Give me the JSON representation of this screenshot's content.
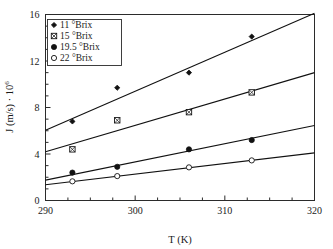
{
  "chart_data": {
    "type": "scatter",
    "title": "",
    "xlabel": "T (K)",
    "ylabel": "J (m/s) · 10",
    "ylabel_exponent": "6",
    "xlim": [
      290,
      320
    ],
    "ylim": [
      0,
      16
    ],
    "x_ticks": [
      290,
      300,
      310,
      320
    ],
    "y_ticks": [
      0,
      4,
      8,
      12,
      16
    ],
    "x_tick_labels": [
      "290",
      "300",
      "310",
      "320"
    ],
    "y_tick_labels": [
      "0",
      "4",
      "8",
      "12",
      "16"
    ],
    "x_minor_step": 2.5,
    "y_minor_step": 1,
    "grid": false,
    "legend_position": "top-left",
    "series": [
      {
        "name": "11 °Brix",
        "marker": "filled-diamond",
        "x": [
          293,
          298,
          306,
          313
        ],
        "values": [
          6.8,
          9.7,
          11.0,
          14.1
        ],
        "fit_line": {
          "x": [
            290,
            320
          ],
          "y": [
            6.05,
            16.1
          ]
        }
      },
      {
        "name": "15 °Brix",
        "marker": "crossed-square",
        "x": [
          293,
          298,
          306,
          313
        ],
        "values": [
          4.4,
          6.9,
          7.6,
          9.3
        ],
        "fit_line": {
          "x": [
            290,
            320
          ],
          "y": [
            4.2,
            11.0
          ]
        }
      },
      {
        "name": "19.5 °Brix",
        "marker": "filled-circle",
        "x": [
          293,
          298,
          306,
          313
        ],
        "values": [
          2.4,
          2.9,
          4.4,
          5.2
        ],
        "fit_line": {
          "x": [
            290,
            320
          ],
          "y": [
            1.75,
            6.45
          ]
        }
      },
      {
        "name": "22 °Brix",
        "marker": "open-circle",
        "x": [
          293,
          298,
          306,
          313
        ],
        "values": [
          1.65,
          2.1,
          2.85,
          3.45
        ],
        "fit_line": {
          "x": [
            290,
            320
          ],
          "y": [
            1.35,
            4.1
          ]
        }
      }
    ]
  },
  "legend": {
    "entries": [
      {
        "label": "11 °Brix",
        "marker": "filled-diamond"
      },
      {
        "label": "15 °Brix",
        "marker": "crossed-square"
      },
      {
        "label": "19.5 °Brix",
        "marker": "filled-circle"
      },
      {
        "label": "22 °Brix",
        "marker": "open-circle"
      }
    ]
  },
  "axes": {
    "x_title": "T (K)",
    "y_title_main": "J (m/s) · 10",
    "y_title_sup": "6"
  }
}
